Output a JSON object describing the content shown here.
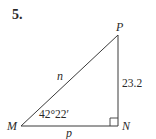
{
  "problem": {
    "number": "5."
  },
  "triangle": {
    "vertices": {
      "M": {
        "label": "M"
      },
      "N": {
        "label": "N"
      },
      "P": {
        "label": "P"
      }
    },
    "sides": {
      "hypotenuse_MP": {
        "label": "n"
      },
      "base_MN": {
        "label": "p"
      },
      "leg_NP": {
        "label": "23.2"
      }
    },
    "angle_M": {
      "label": "42°22′"
    },
    "right_angle_at": "N"
  },
  "colors": {
    "stroke": "#3a3a3a",
    "text": "#2a2a2a",
    "background": "#ffffff"
  }
}
